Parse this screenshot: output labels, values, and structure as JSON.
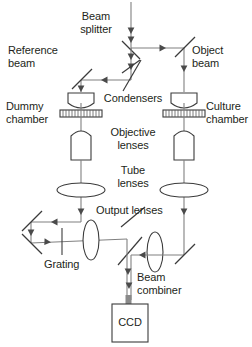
{
  "figure": {
    "kind": "optical-setup-diagram",
    "background_color": "#ffffff",
    "beam_color": "#808080",
    "optic_color": "#3b3b3b",
    "text_color": "#231f20"
  },
  "labels": {
    "beam_splitter": "Beam\nsplitter",
    "reference_beam": "Reference\nbeam",
    "object_beam": "Object\nbeam",
    "dummy_chamber": "Dummy\nchamber",
    "culture_chamber": "Culture\nchamber",
    "condensers": "Condensers",
    "objective_lenses": "Objective\nlenses",
    "tube_lenses": "Tube\nlenses",
    "output_lenses": "Output lenses",
    "grating": "Grating",
    "beam_combiner": "Beam\ncombiner",
    "ccd": "CCD"
  },
  "components": [
    {
      "name": "beam-splitter",
      "type": "beamsplitter",
      "label": "Beam splitter"
    },
    {
      "name": "reference-beam-path",
      "type": "beam",
      "label": "Reference beam"
    },
    {
      "name": "object-beam-path",
      "type": "beam",
      "label": "Object beam"
    },
    {
      "name": "condenser-left",
      "type": "condenser",
      "label": "Condensers"
    },
    {
      "name": "condenser-right",
      "type": "condenser",
      "label": "Condensers"
    },
    {
      "name": "dummy-chamber",
      "type": "sample-chamber",
      "label": "Dummy chamber"
    },
    {
      "name": "culture-chamber",
      "type": "sample-chamber",
      "label": "Culture chamber"
    },
    {
      "name": "objective-lens-left",
      "type": "objective",
      "label": "Objective lenses"
    },
    {
      "name": "objective-lens-right",
      "type": "objective",
      "label": "Objective lenses"
    },
    {
      "name": "tube-lens-left",
      "type": "lens",
      "label": "Tube lenses"
    },
    {
      "name": "tube-lens-right",
      "type": "lens",
      "label": "Tube lenses"
    },
    {
      "name": "output-lens-left",
      "type": "lens",
      "label": "Output lenses"
    },
    {
      "name": "output-lens-right",
      "type": "lens",
      "label": "Output lenses"
    },
    {
      "name": "grating",
      "type": "grating",
      "label": "Grating"
    },
    {
      "name": "beam-combiner",
      "type": "beamcombiner",
      "label": "Beam combiner"
    },
    {
      "name": "ccd-detector",
      "type": "detector",
      "label": "CCD"
    }
  ]
}
